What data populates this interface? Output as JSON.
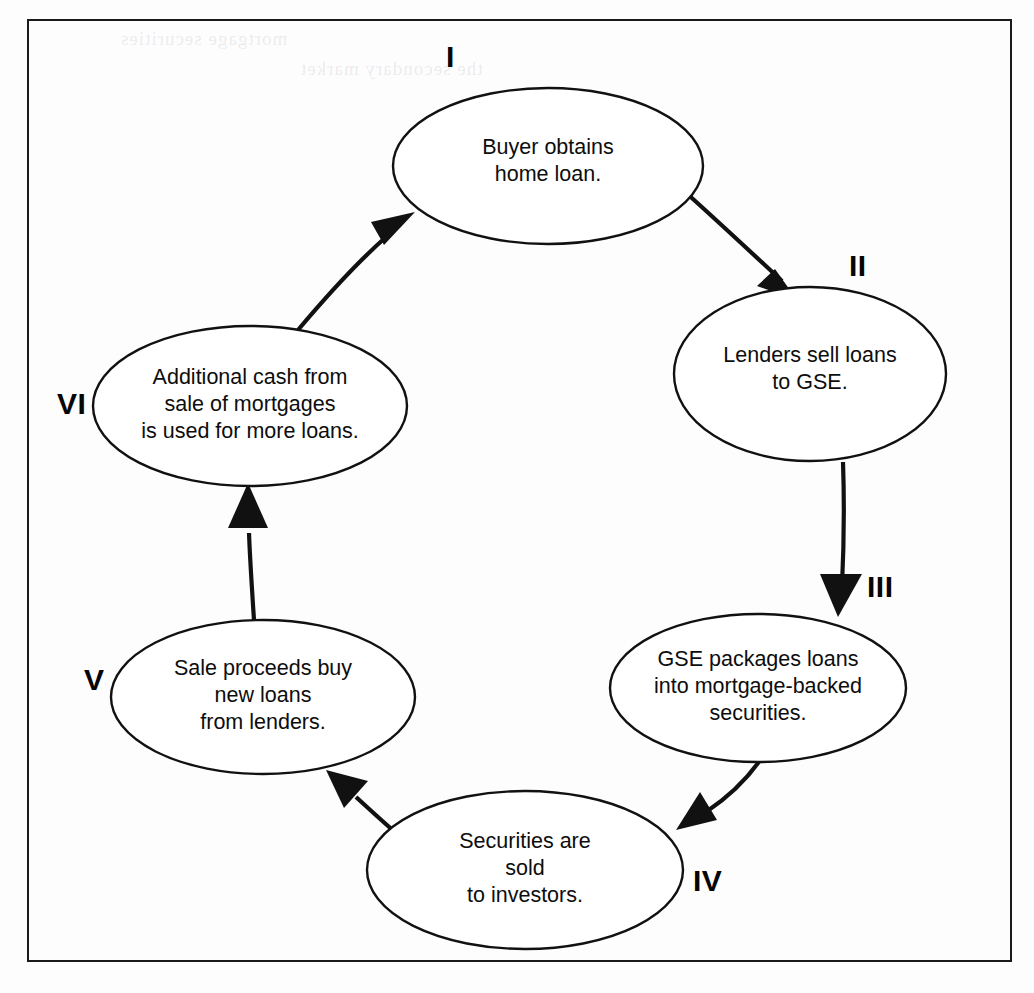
{
  "figure": {
    "kind": "cycle-diagram",
    "title": "",
    "border": true,
    "background_color": "#ffffff",
    "ink_color": "#111111"
  },
  "nodes": [
    {
      "id": "node-1",
      "numeral": "I",
      "text": "Buyer obtains\nhome loan.",
      "lines": [
        "Buyer obtains",
        "home loan."
      ]
    },
    {
      "id": "node-2",
      "numeral": "II",
      "text": "Lenders sell loans\nto GSE.",
      "lines": [
        "Lenders sell loans",
        "to GSE."
      ]
    },
    {
      "id": "node-3",
      "numeral": "III",
      "text": "GSE packages loans\ninto mortgage-backed\nsecurities.",
      "lines": [
        "GSE packages loans",
        "into mortgage-backed",
        "securities."
      ]
    },
    {
      "id": "node-4",
      "numeral": "IV",
      "text": "Securities are\nsold\nto investors.",
      "lines": [
        "Securities are",
        "sold",
        "to investors."
      ]
    },
    {
      "id": "node-5",
      "numeral": "V",
      "text": "Sale proceeds buy\nnew loans\nfrom lenders.",
      "lines": [
        "Sale proceeds buy",
        "new loans",
        "from lenders."
      ]
    },
    {
      "id": "node-6",
      "numeral": "VI",
      "text": "Additional cash from\nsale of mortgages\nis used for more loans.",
      "lines": [
        "Additional cash from",
        "sale of mortgages",
        "is used for more loans."
      ]
    }
  ],
  "edges": [
    {
      "id": "edge-1-2",
      "from": "I",
      "to": "II"
    },
    {
      "id": "edge-2-3",
      "from": "II",
      "to": "III"
    },
    {
      "id": "edge-3-4",
      "from": "III",
      "to": "IV"
    },
    {
      "id": "edge-4-5",
      "from": "IV",
      "to": "V"
    },
    {
      "id": "edge-5-6",
      "from": "V",
      "to": "VI"
    },
    {
      "id": "edge-6-1",
      "from": "VI",
      "to": "I"
    }
  ],
  "bleed_through": {
    "line_1": "mortgage securities",
    "line_2": "the secondary market",
    "line_3": "loans are pooled"
  }
}
